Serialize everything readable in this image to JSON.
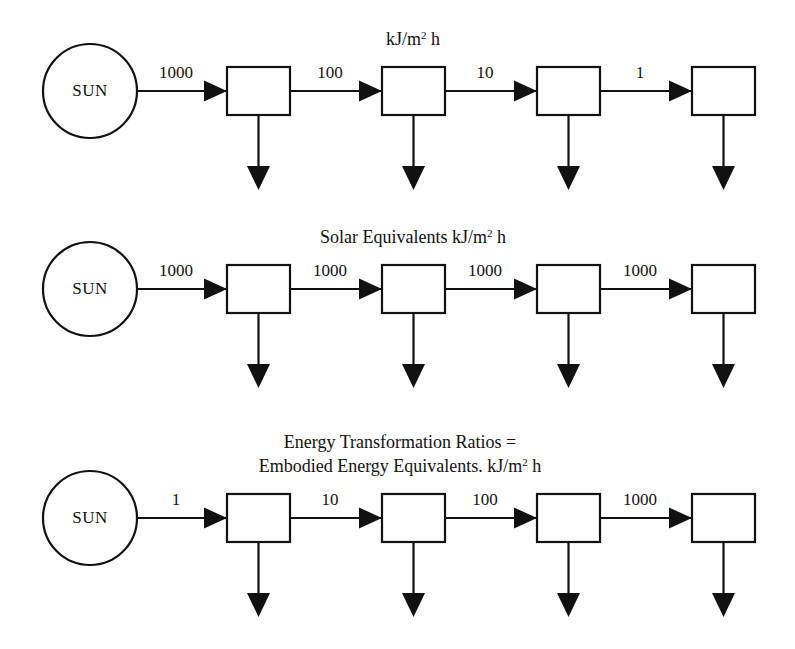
{
  "figure": {
    "background_color": "#ffffff",
    "line_color": "#111111"
  },
  "geometry": {
    "width": 795,
    "height": 649,
    "source_cx": 90,
    "source_r": 47,
    "box_width": 63,
    "box_height": 48,
    "box_x_positions": [
      227,
      382,
      537,
      692
    ],
    "row_axis_y": [
      91,
      289,
      518
    ],
    "box_top_offset": -24,
    "down_arrow_length": 75
  },
  "rows": [
    {
      "id": "row-energy-flow",
      "caption_lines": [
        {
          "text": "kJ/m",
          "sup": "2",
          "tail": " h"
        }
      ],
      "caption_x": 413,
      "caption_y": 45,
      "source": {
        "label": "SUN"
      },
      "nodes": [
        {
          "id": "node-1-1",
          "label": ""
        },
        {
          "id": "node-1-2",
          "label": ""
        },
        {
          "id": "node-1-3",
          "label": ""
        },
        {
          "id": "node-1-4",
          "label": ""
        }
      ],
      "flows": [
        "1000",
        "100",
        "10",
        "1"
      ]
    },
    {
      "id": "row-solar-equivalents",
      "caption_lines": [
        {
          "text": "Solar Equivalents kJ/m",
          "sup": "2",
          "tail": " h"
        }
      ],
      "caption_x": 413,
      "caption_y": 243,
      "source": {
        "label": "SUN"
      },
      "nodes": [
        {
          "id": "node-2-1",
          "label": ""
        },
        {
          "id": "node-2-2",
          "label": ""
        },
        {
          "id": "node-2-3",
          "label": ""
        },
        {
          "id": "node-2-4",
          "label": ""
        }
      ],
      "flows": [
        "1000",
        "1000",
        "1000",
        "1000"
      ]
    },
    {
      "id": "row-transformation-ratios",
      "caption_lines": [
        {
          "text": "Energy Transformation Ratios =",
          "sup": "",
          "tail": ""
        },
        {
          "text": "Embodied Energy Equivalents. kJ/m",
          "sup": "2",
          "tail": " h"
        }
      ],
      "caption_x": 400,
      "caption_y": 448,
      "source": {
        "label": "SUN"
      },
      "nodes": [
        {
          "id": "node-3-1",
          "label": ""
        },
        {
          "id": "node-3-2",
          "label": ""
        },
        {
          "id": "node-3-3",
          "label": ""
        },
        {
          "id": "node-3-4",
          "label": ""
        }
      ],
      "flows": [
        "1",
        "10",
        "100",
        "1000"
      ]
    }
  ],
  "chart_data": {
    "type": "diagram",
    "series": [
      {
        "name": "kJ/m2 h",
        "values": [
          1000,
          100,
          10,
          1
        ]
      },
      {
        "name": "Solar Equivalents kJ/m2 h",
        "values": [
          1000,
          1000,
          1000,
          1000
        ]
      },
      {
        "name": "Energy Transformation Ratios = Embodied Energy Equivalents. kJ/m2 h",
        "values": [
          1,
          10,
          100,
          1000
        ]
      }
    ],
    "categories": [
      "Step 1",
      "Step 2",
      "Step 3",
      "Step 4"
    ]
  }
}
